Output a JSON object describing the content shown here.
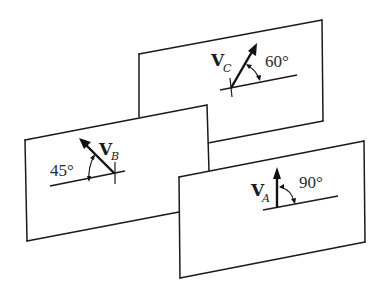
{
  "diagram": {
    "panels": [
      {
        "id": "C",
        "vector_symbol": "V",
        "vector_subscript": "C",
        "angle_label": "60°",
        "angle_degrees": 60
      },
      {
        "id": "B",
        "vector_symbol": "V",
        "vector_subscript": "B",
        "angle_label": "45°",
        "angle_degrees": 45
      },
      {
        "id": "A",
        "vector_symbol": "V",
        "vector_subscript": "A",
        "angle_label": "90°",
        "angle_degrees": 90
      }
    ],
    "colors": {
      "line": "#1a1a1a",
      "background": "#ffffff"
    }
  }
}
